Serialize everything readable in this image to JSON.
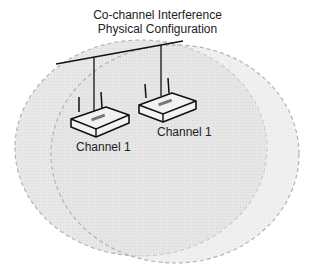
{
  "title": {
    "line1": "Co-channel Interference",
    "line2": "Physical Configuration"
  },
  "access_points": [
    {
      "label": "Channel 1"
    },
    {
      "label": "Channel 1"
    }
  ],
  "colors": {
    "coverage_fill": "#e6e6e6",
    "coverage_stroke": "#b5b5b5",
    "line": "#111111"
  }
}
